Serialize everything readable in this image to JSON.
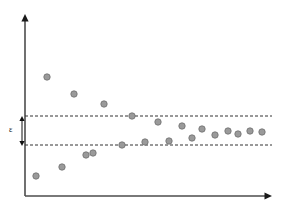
{
  "figure": {
    "background_color": "#ffffff",
    "axis_color": "#4d4d4d",
    "band_line_color": "#333333",
    "point_fill_color": "#9a9a9a",
    "point_stroke_color": "#6e6e6e",
    "point_radius": 3.2
  },
  "annotations": {
    "epsilon_label": "ε",
    "epsilon_label_x": 9,
    "epsilon_label_y": 126,
    "epsilon_arrow_x": 22,
    "epsilon_arrow_top_y": 116,
    "epsilon_arrow_bottom_y": 146
  },
  "axes": {
    "y_axis": {
      "x": 25,
      "top_y": 14,
      "bottom_y": 196
    },
    "x_axis": {
      "y": 196,
      "left_x": 25,
      "right_x": 272
    },
    "arrow_size": 5
  },
  "chart_data": {
    "type": "scatter",
    "title": "",
    "subtitle": "",
    "xlabel": "",
    "ylabel": "",
    "grid": false,
    "legend": "none",
    "xlim": [
      25,
      272
    ],
    "ylim": [
      196,
      14
    ],
    "annotations": [
      {
        "text": "ε",
        "description": "tolerance band half-width marked by a vertical double-headed arrow between the two dashed lines"
      }
    ],
    "bands": {
      "description": "Two horizontal dashed reference lines bounding a convergence tolerance band of width epsilon",
      "upper_line_y": 116,
      "lower_line_y": 145,
      "line_style": "dashed",
      "x_start": 25,
      "x_end": 272
    },
    "series": [
      {
        "name": "observations",
        "marker": "circle",
        "points": [
          {
            "x": 36,
            "y": 176
          },
          {
            "x": 47,
            "y": 77
          },
          {
            "x": 62,
            "y": 167
          },
          {
            "x": 74,
            "y": 94
          },
          {
            "x": 86,
            "y": 155
          },
          {
            "x": 93,
            "y": 153
          },
          {
            "x": 104,
            "y": 104
          },
          {
            "x": 122,
            "y": 145
          },
          {
            "x": 132,
            "y": 116
          },
          {
            "x": 145,
            "y": 142
          },
          {
            "x": 158,
            "y": 122
          },
          {
            "x": 169,
            "y": 141
          },
          {
            "x": 182,
            "y": 126
          },
          {
            "x": 192,
            "y": 138
          },
          {
            "x": 202,
            "y": 129
          },
          {
            "x": 215,
            "y": 135
          },
          {
            "x": 228,
            "y": 131
          },
          {
            "x": 238,
            "y": 134
          },
          {
            "x": 250,
            "y": 131
          },
          {
            "x": 262,
            "y": 132
          }
        ]
      }
    ]
  }
}
